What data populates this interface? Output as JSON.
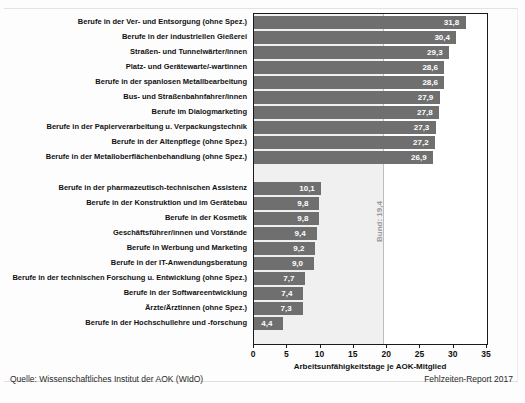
{
  "chart_data": {
    "type": "bar",
    "orientation": "horizontal",
    "title": "",
    "xlabel": "Arbeitsunfähigkeitstage je AOK-Mitglied",
    "ylabel": "",
    "xlim": [
      0,
      35
    ],
    "xticks": [
      0,
      5,
      10,
      15,
      20,
      25,
      30,
      35
    ],
    "grid": false,
    "legend": null,
    "reference_line": {
      "label": "Bund: 19,4",
      "value": 19.4
    },
    "groups": [
      {
        "name": "highest",
        "categories": [
          "Berufe in der Ver- und Entsorgung (ohne Spez.)",
          "Berufe in der industriellen Gießerei",
          "Straßen- und Tunnelwärter/innen",
          "Platz- und Gerätewarte/-wartinnen",
          "Berufe in der spanlosen Metallbearbeitung",
          "Bus- und Straßenbahnfahrer/innen",
          "Berufe im Dialogmarketing",
          "Berufe in der Papierverarbeitung u. Verpackungstechnik",
          "Berufe in der Altenpflege (ohne Spez.)",
          "Berufe in der Metalloberflächenbehandlung (ohne Spez.)"
        ],
        "values": [
          31.8,
          30.4,
          29.3,
          28.6,
          28.6,
          27.9,
          27.8,
          27.3,
          27.2,
          26.9
        ],
        "value_labels": [
          "31,8",
          "30,4",
          "29,3",
          "28,6",
          "28,6",
          "27,9",
          "27,8",
          "27,3",
          "27,2",
          "26,9"
        ]
      },
      {
        "name": "lowest",
        "categories": [
          "Berufe in der pharmazeutisch-technischen Assistenz",
          "Berufe in der Konstruktion und im Gerätebau",
          "Berufe in der Kosmetik",
          "Geschäftsführer/innen und Vorstände",
          "Berufe in Werbung und Marketing",
          "Berufe in der IT-Anwendungsberatung",
          "Berufe in der technischen Forschung u. Entwicklung (ohne Spez.)",
          "Berufe in der Softwareentwicklung",
          "Ärzte/Ärztinnen (ohne Spez.)",
          "Berufe in der Hochschullehre und -forschung"
        ],
        "values": [
          10.1,
          9.8,
          9.8,
          9.4,
          9.2,
          9.0,
          7.7,
          7.4,
          7.3,
          4.4
        ],
        "value_labels": [
          "10,1",
          "9,8",
          "9,8",
          "9,4",
          "9,2",
          "9,0",
          "7,7",
          "7,4",
          "7,3",
          "4,4"
        ]
      }
    ]
  },
  "footer": {
    "source": "Quelle: Wissenschaftliches Institut der AOK (WIdO)",
    "report": "Fehlzeiten-Report 2017"
  },
  "colors": {
    "bar": "#6f6f6f",
    "plot_band": "#f0f0f0",
    "reference_line": "#bdbdbd",
    "frame": "#1a1a1a",
    "value_text": "#ffffff"
  }
}
